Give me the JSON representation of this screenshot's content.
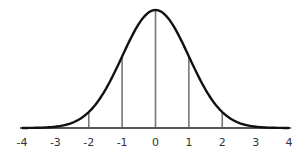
{
  "chart_data": {
    "type": "line",
    "title": "",
    "xlabel": "",
    "ylabel": "",
    "xlim": [
      -4,
      4
    ],
    "x_ticks": [
      -4,
      -3,
      -2,
      -1,
      0,
      1,
      2,
      3,
      4
    ],
    "x_tick_labels": [
      "-4",
      "-3",
      "-2",
      "-1",
      "0",
      "1",
      "2",
      "3",
      "4"
    ],
    "vertical_lines_at": [
      -2,
      -1,
      0,
      1,
      2
    ],
    "series": [
      {
        "name": "normal density",
        "x": [
          -4,
          -3.5,
          -3,
          -2.5,
          -2,
          -1.5,
          -1,
          -0.5,
          0,
          0.5,
          1,
          1.5,
          2,
          2.5,
          3,
          3.5,
          4
        ],
        "values": [
          0.0001,
          0.0009,
          0.0044,
          0.0175,
          0.054,
          0.1295,
          0.242,
          0.3521,
          0.3989,
          0.3521,
          0.242,
          0.1295,
          0.054,
          0.0175,
          0.0044,
          0.0009,
          0.0001
        ]
      }
    ],
    "grid": false,
    "legend": null,
    "colors": {
      "curve": "#111111",
      "axis": "#555555",
      "vlines": "#777777"
    }
  }
}
